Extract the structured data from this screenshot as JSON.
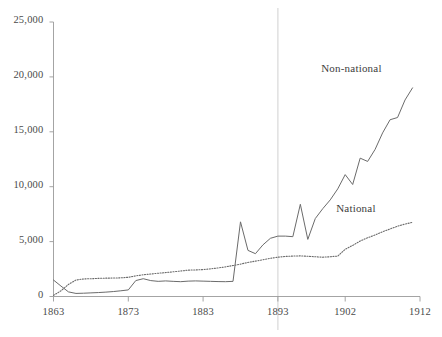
{
  "chart_data": {
    "type": "line",
    "title": "",
    "subtitle": "",
    "xlabel": "",
    "ylabel": "",
    "xlim": [
      1863,
      1912
    ],
    "ylim": [
      0,
      25000
    ],
    "grid": false,
    "legend_position": "inline-annotations",
    "y_ticks": [
      0,
      5000,
      10000,
      15000,
      20000,
      25000
    ],
    "y_tick_labels": [
      "0",
      "5,000",
      "10,000",
      "15,000",
      "20,000",
      "25,000"
    ],
    "x_ticks": [
      1863,
      1873,
      1883,
      1893,
      1902,
      1912
    ],
    "x_tick_labels": [
      "1863",
      "1873",
      "1883",
      "1893",
      "1902",
      "1912"
    ],
    "annotations": [
      {
        "text": "Non-national",
        "x": 1902,
        "y": 20600
      },
      {
        "text": "National",
        "x": 1904,
        "y": 7900
      }
    ],
    "reference_lines": [
      {
        "orientation": "vertical",
        "x": 1893,
        "color": "#d8d8d8"
      }
    ],
    "series": [
      {
        "name": "Non-national",
        "style": "solid",
        "color": "#6b6b6b",
        "x": [
          1863,
          1864,
          1865,
          1866,
          1867,
          1868,
          1869,
          1870,
          1871,
          1872,
          1873,
          1874,
          1875,
          1876,
          1877,
          1878,
          1879,
          1880,
          1881,
          1882,
          1883,
          1884,
          1885,
          1886,
          1887,
          1888,
          1889,
          1890,
          1891,
          1892,
          1893,
          1894,
          1895,
          1896,
          1897,
          1898,
          1899,
          1900,
          1901,
          1902,
          1903,
          1904,
          1905,
          1906,
          1907,
          1908,
          1909,
          1910,
          1911
        ],
        "values": [
          1500,
          950,
          420,
          280,
          300,
          330,
          360,
          400,
          450,
          520,
          600,
          1450,
          1620,
          1450,
          1380,
          1420,
          1380,
          1350,
          1400,
          1420,
          1400,
          1380,
          1360,
          1350,
          1380,
          6800,
          4200,
          3900,
          4700,
          5300,
          5500,
          5500,
          5450,
          8400,
          5200,
          7100,
          8000,
          8800,
          9800,
          11100,
          10200,
          12600,
          12300,
          13400,
          14900,
          16100,
          16300,
          17900,
          19000
        ]
      },
      {
        "name": "National",
        "style": "dotted",
        "color": "#6b6b6b",
        "x": [
          1863,
          1864,
          1865,
          1866,
          1867,
          1868,
          1869,
          1870,
          1871,
          1872,
          1873,
          1874,
          1875,
          1876,
          1877,
          1878,
          1879,
          1880,
          1881,
          1882,
          1883,
          1884,
          1885,
          1886,
          1887,
          1888,
          1889,
          1890,
          1891,
          1892,
          1893,
          1894,
          1895,
          1896,
          1897,
          1898,
          1899,
          1900,
          1901,
          1902,
          1903,
          1904,
          1905,
          1906,
          1907,
          1908,
          1909,
          1910,
          1911
        ],
        "values": [
          100,
          520,
          1100,
          1500,
          1600,
          1620,
          1650,
          1670,
          1680,
          1700,
          1750,
          1880,
          1980,
          2050,
          2120,
          2180,
          2250,
          2320,
          2400,
          2420,
          2450,
          2520,
          2600,
          2700,
          2820,
          2950,
          3100,
          3220,
          3350,
          3480,
          3580,
          3650,
          3680,
          3700,
          3660,
          3620,
          3580,
          3620,
          3680,
          4300,
          4650,
          5050,
          5350,
          5600,
          5900,
          6150,
          6400,
          6600,
          6750
        ]
      }
    ]
  },
  "axis": {
    "y_axis_name": "y-axis",
    "x_axis_name": "x-axis"
  }
}
